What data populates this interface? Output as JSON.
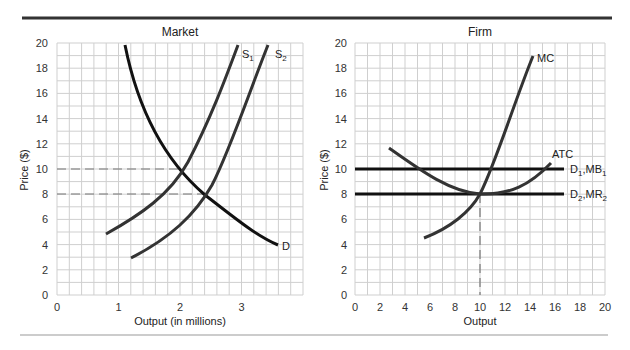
{
  "chart_data": [
    {
      "type": "line",
      "title": "Market",
      "xlabel": "Output (in millions)",
      "ylabel": "Price ($)",
      "xlim": [
        0,
        4
      ],
      "ylim": [
        0,
        20
      ],
      "x_ticks": [
        "0",
        "1",
        "2",
        "3"
      ],
      "y_ticks": [
        "0",
        "2",
        "4",
        "6",
        "8",
        "10",
        "12",
        "14",
        "16",
        "18",
        "20"
      ],
      "grid": true,
      "series": [
        {
          "name": "D",
          "points": [
            [
              1.1,
              20
            ],
            [
              1.4,
              15
            ],
            [
              1.7,
              12
            ],
            [
              2.0,
              10
            ],
            [
              2.4,
              8
            ],
            [
              2.9,
              6
            ],
            [
              3.6,
              4
            ]
          ]
        },
        {
          "name": "S1",
          "points": [
            [
              0.8,
              4.8
            ],
            [
              1.3,
              6.5
            ],
            [
              1.7,
              8.2
            ],
            [
              2.0,
              10
            ],
            [
              2.4,
              13
            ],
            [
              2.8,
              17
            ],
            [
              3.0,
              20
            ]
          ]
        },
        {
          "name": "S2",
          "points": [
            [
              1.2,
              3
            ],
            [
              1.8,
              5.2
            ],
            [
              2.2,
              6.8
            ],
            [
              2.4,
              8
            ],
            [
              2.8,
              11
            ],
            [
              3.2,
              15.5
            ],
            [
              3.5,
              20
            ]
          ]
        }
      ],
      "reference_lines": [
        {
          "type": "dashed-horizontal",
          "y": 10,
          "x_to": 2.0
        },
        {
          "type": "dashed-horizontal",
          "y": 8,
          "x_to": 2.4
        }
      ]
    },
    {
      "type": "line",
      "title": "Firm",
      "xlabel": "Output",
      "ylabel": "Price ($)",
      "xlim": [
        0,
        20
      ],
      "ylim": [
        0,
        20
      ],
      "x_ticks": [
        "0",
        "2",
        "4",
        "6",
        "8",
        "10",
        "12",
        "14",
        "16",
        "18",
        "20"
      ],
      "y_ticks": [
        "0",
        "2",
        "4",
        "6",
        "8",
        "10",
        "12",
        "14",
        "16",
        "18",
        "20"
      ],
      "grid": true,
      "series": [
        {
          "name": "MC",
          "points": [
            [
              5.5,
              4.5
            ],
            [
              8,
              6
            ],
            [
              10,
              8
            ],
            [
              11,
              10
            ],
            [
              12,
              12.5
            ],
            [
              13,
              15.5
            ],
            [
              14.2,
              19
            ]
          ]
        },
        {
          "name": "ATC",
          "points": [
            [
              2.7,
              11.7
            ],
            [
              5,
              10
            ],
            [
              7,
              8.7
            ],
            [
              10,
              8
            ],
            [
              12,
              8.4
            ],
            [
              14,
              9.3
            ],
            [
              15.7,
              10.5
            ]
          ]
        },
        {
          "name": "D1,MR1",
          "points": [
            [
              0,
              10
            ],
            [
              16.7,
              10
            ]
          ]
        },
        {
          "name": "D2,MR2",
          "points": [
            [
              0,
              8
            ],
            [
              16.7,
              8
            ]
          ]
        }
      ],
      "reference_lines": [
        {
          "type": "dashed-vertical",
          "x": 10,
          "y_to": 8
        }
      ]
    }
  ],
  "market": {
    "title": "Market",
    "xlabel": "Output (in millions)",
    "ylabel": "Price ($)",
    "labels": {
      "d": "D",
      "s1": "S",
      "s1_sub": "1",
      "s2": "S",
      "s2_sub": "2"
    }
  },
  "firm": {
    "title": "Firm",
    "xlabel": "Output",
    "ylabel": "Price ($)",
    "labels": {
      "mc": "MC",
      "atc": "ATC",
      "d1": "D",
      "d1_sub": "1",
      "mr1": ",MB",
      "mr1_sub": "1",
      "d2": "D",
      "d2_sub": "2",
      "mr2": ",MR",
      "mr2_sub": "2"
    }
  }
}
